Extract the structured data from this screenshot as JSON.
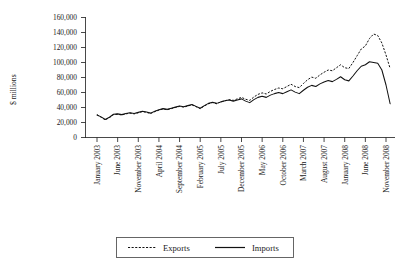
{
  "chart_data": {
    "type": "line",
    "title": "",
    "xlabel": "",
    "ylabel": "$ millions",
    "ylim": [
      0,
      160000
    ],
    "ytick_labels": [
      "0",
      "20,000",
      "40,000",
      "60,000",
      "80,000",
      "100,000",
      "120,000",
      "140,000",
      "160,000"
    ],
    "ytick_values": [
      0,
      20000,
      40000,
      60000,
      80000,
      100000,
      120000,
      140000,
      160000
    ],
    "grid": false,
    "legend_position": "bottom-center",
    "xtick_labels": [
      "January 2003",
      "June 2003",
      "November 2003",
      "April 2004",
      "September 2004",
      "February 2005",
      "July 2005",
      "December 2005",
      "May 2006",
      "October 2006",
      "March 2007",
      "August 2007",
      "January 2008",
      "June 2008",
      "November 2008"
    ],
    "xtick_index": [
      0,
      5,
      10,
      15,
      20,
      25,
      30,
      35,
      40,
      45,
      50,
      55,
      60,
      65,
      70
    ],
    "x_count": 72,
    "series": [
      {
        "name": "Exports",
        "style": "dashed",
        "values": [
          30500,
          27000,
          23500,
          26500,
          30500,
          31000,
          30000,
          31500,
          32500,
          31500,
          33000,
          34500,
          33500,
          32000,
          34500,
          36500,
          38000,
          37000,
          38500,
          40000,
          41500,
          40500,
          42000,
          43500,
          41000,
          38500,
          42000,
          45000,
          46500,
          45000,
          47500,
          49000,
          50500,
          49500,
          51500,
          53500,
          51000,
          49500,
          54000,
          57500,
          59500,
          58000,
          61500,
          64000,
          66000,
          65000,
          68000,
          71000,
          68000,
          66500,
          72000,
          77000,
          80500,
          79000,
          83500,
          87000,
          90000,
          89000,
          93000,
          97000,
          93000,
          92000,
          100000,
          109000,
          118000,
          122000,
          132000,
          138000,
          136000,
          126000,
          110000,
          92000
        ]
      },
      {
        "name": "Imports",
        "style": "solid",
        "values": [
          30000,
          27500,
          24000,
          27000,
          31000,
          31500,
          30500,
          32000,
          33000,
          32000,
          33500,
          35000,
          34000,
          32500,
          35000,
          37000,
          38500,
          37500,
          39000,
          40500,
          42000,
          41000,
          42500,
          44000,
          41500,
          39000,
          42500,
          45500,
          47000,
          45500,
          47500,
          49000,
          50000,
          48500,
          50000,
          51500,
          48500,
          46500,
          50500,
          53500,
          55000,
          53500,
          56500,
          58500,
          60000,
          58500,
          61000,
          63500,
          60500,
          58500,
          63000,
          67000,
          69500,
          68000,
          71500,
          74000,
          76000,
          74500,
          77500,
          81000,
          77000,
          75500,
          82000,
          89000,
          95000,
          97000,
          101000,
          100000,
          99000,
          90000,
          70000,
          45000
        ]
      }
    ]
  },
  "legend": {
    "exports_label": "Exports",
    "imports_label": "Imports"
  },
  "axis": {
    "y_title": "$ millions"
  }
}
